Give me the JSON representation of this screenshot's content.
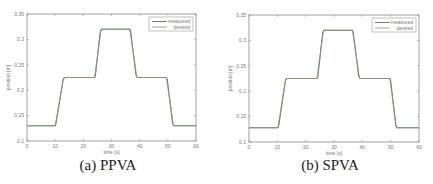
{
  "chart_data": [
    {
      "type": "line",
      "title": "",
      "caption": "(a) PPVA",
      "xlabel": "time [s]",
      "ylabel": "position [m]",
      "xlim": [
        0,
        60
      ],
      "ylim": [
        0.1,
        0.35
      ],
      "xticks": [
        0,
        10,
        20,
        30,
        40,
        50,
        60
      ],
      "yticks": [
        0.1,
        0.15,
        0.2,
        0.25,
        0.3,
        0.35
      ],
      "ytick_labels": [
        "0.1",
        "0.15",
        "0.2",
        "0.25",
        "0.3",
        "0.35"
      ],
      "grid": false,
      "legend_position": "upper right",
      "series": [
        {
          "name": "measured",
          "color": "#6a6a6a",
          "x": [
            0,
            10,
            10.3,
            12.8,
            13.3,
            24,
            24.3,
            26,
            26.5,
            36.5,
            36.8,
            38.7,
            39.2,
            49.5,
            49.8,
            51.7,
            52.2,
            60
          ],
          "y": [
            0.13,
            0.13,
            0.135,
            0.22,
            0.225,
            0.225,
            0.23,
            0.315,
            0.32,
            0.32,
            0.315,
            0.23,
            0.225,
            0.225,
            0.22,
            0.135,
            0.13,
            0.13
          ]
        },
        {
          "name": "desired",
          "color": "#7fa77f",
          "x": [
            0,
            10,
            13,
            24,
            26.3,
            36.5,
            39,
            49.5,
            52,
            60
          ],
          "y": [
            0.13,
            0.13,
            0.225,
            0.225,
            0.32,
            0.32,
            0.225,
            0.225,
            0.13,
            0.13
          ]
        }
      ]
    },
    {
      "type": "line",
      "title": "",
      "caption": "(b) SPVA",
      "xlabel": "time [s]",
      "ylabel": "position [m]",
      "xlim": [
        0,
        60
      ],
      "ylim": [
        0.1,
        0.35
      ],
      "xticks": [
        0,
        10,
        20,
        30,
        40,
        50,
        60
      ],
      "yticks": [
        0.1,
        0.15,
        0.2,
        0.25,
        0.3,
        0.35
      ],
      "ytick_labels": [
        "0.1",
        "0.15",
        "0.2",
        "0.25",
        "0.3",
        "0.35"
      ],
      "grid": false,
      "legend_position": "upper right",
      "series": [
        {
          "name": "measured",
          "color": "#6a6a6a",
          "x": [
            0,
            10.2,
            10.5,
            12.8,
            13.3,
            24,
            24.3,
            26,
            26.5,
            36.5,
            36.8,
            38.7,
            39.2,
            49.7,
            50,
            51.8,
            52.3,
            60
          ],
          "y": [
            0.128,
            0.128,
            0.133,
            0.22,
            0.225,
            0.225,
            0.23,
            0.315,
            0.32,
            0.32,
            0.315,
            0.23,
            0.225,
            0.225,
            0.22,
            0.133,
            0.128,
            0.128
          ]
        },
        {
          "name": "desired",
          "color": "#7fa77f",
          "x": [
            0,
            10.2,
            13,
            24,
            26.3,
            36.5,
            39,
            49.7,
            52,
            60
          ],
          "y": [
            0.128,
            0.128,
            0.225,
            0.225,
            0.32,
            0.32,
            0.225,
            0.225,
            0.128,
            0.128
          ]
        }
      ]
    }
  ]
}
